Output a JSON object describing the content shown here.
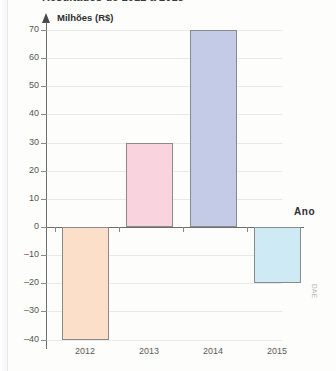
{
  "figure": {
    "title": "Resultados de 2012 a 2015",
    "watermark": "DAE"
  },
  "chart_data": {
    "type": "bar",
    "title": "Resultados de 2012 a 2015",
    "xlabel": "Ano",
    "ylabel": "Milhões (R$)",
    "categories": [
      "2012",
      "2013",
      "2014",
      "2015"
    ],
    "values": [
      -40,
      30,
      70,
      -20
    ],
    "bar_colors": [
      "#fbdfc8",
      "#f9d3dd",
      "#c3cbe6",
      "#cdeaf5"
    ],
    "bar_border_color": "#8a8a8a",
    "ylim": [
      -40,
      70
    ],
    "yticks": [
      70,
      60,
      50,
      40,
      30,
      20,
      10,
      0,
      -10,
      -20,
      -30,
      -40
    ],
    "ytick_labels": [
      "70",
      "60",
      "50",
      "40",
      "30",
      "20",
      "10",
      "0",
      "–10",
      "–20",
      "–30",
      "–40"
    ],
    "grid": true,
    "legend": false,
    "axis_color": "#6d6d6d",
    "background": "#fdfdfc"
  }
}
